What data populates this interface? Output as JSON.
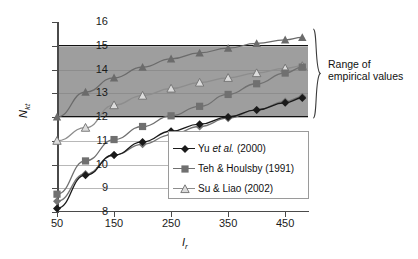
{
  "chart_data": {
    "type": "line",
    "title": "",
    "xlabel": "Ir",
    "ylabel": "Nkt",
    "xlim": [
      50,
      490
    ],
    "ylim": [
      8,
      16
    ],
    "grid": true,
    "legend_position": "inside-lower-right",
    "x_ticks": [
      50,
      150,
      250,
      350,
      450
    ],
    "y_ticks": [
      8,
      9,
      10,
      11,
      12,
      13,
      14,
      15,
      16
    ],
    "x": [
      50,
      100,
      150,
      200,
      250,
      300,
      350,
      400,
      450,
      480
    ],
    "series": [
      {
        "name": "upper-solid-triangle",
        "marker": "filled-triangle",
        "color": "#6b6b6b",
        "values": [
          12.0,
          13.05,
          13.65,
          14.1,
          14.45,
          14.7,
          14.9,
          15.1,
          15.25,
          15.35
        ]
      },
      {
        "name": "Su & Liao (2002)",
        "marker": "open-triangle",
        "color": "#8d8d8d",
        "values": [
          11.0,
          11.55,
          12.5,
          12.9,
          13.2,
          13.45,
          13.65,
          13.85,
          14.05,
          14.15
        ]
      },
      {
        "name": "Teh & Houlsby (1991)",
        "marker": "filled-square",
        "color": "#707070",
        "values": [
          8.75,
          10.15,
          11.05,
          11.6,
          12.05,
          12.45,
          12.95,
          13.4,
          13.85,
          14.1
        ]
      },
      {
        "name": "gray-diamond",
        "marker": "filled-diamond-gray",
        "color": "#757575",
        "values": [
          8.45,
          9.6,
          10.4,
          10.85,
          11.25,
          11.6,
          11.95,
          12.3,
          12.65,
          12.85
        ]
      },
      {
        "name": "Yu et al. (2000)",
        "marker": "filled-diamond",
        "color": "#1a1a1a",
        "values": [
          8.15,
          9.55,
          10.4,
          10.95,
          11.4,
          11.7,
          12.0,
          12.3,
          12.6,
          12.8
        ]
      }
    ],
    "shaded_band": {
      "label": "Range of empirical values",
      "y_min": 12,
      "y_max": 15,
      "color": "#9e9e9e"
    },
    "annotation": {
      "line1": "Range of",
      "line2": "empirical values"
    },
    "legend_entries": [
      {
        "label_main": "Yu ",
        "label_italic": "et al.",
        "label_tail": " (2000)",
        "marker": "filled-diamond",
        "color": "#1a1a1a"
      },
      {
        "label_main": "Teh & Houlsby (1991)",
        "label_italic": "",
        "label_tail": "",
        "marker": "filled-square",
        "color": "#707070"
      },
      {
        "label_main": "Su & Liao (2002)",
        "label_italic": "",
        "label_tail": "",
        "marker": "open-triangle",
        "color": "#8d8d8d"
      }
    ]
  },
  "axis": {
    "y_title_main": "N",
    "y_title_sub": "kt",
    "x_title_main": "I",
    "x_title_sub": "r"
  }
}
